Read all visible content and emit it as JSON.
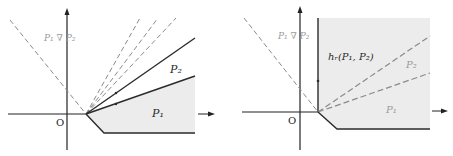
{
  "colors": {
    "axis": "#222222",
    "solid_line": "#2b2b2b",
    "dashed_line": "#8a8a8a",
    "fill": "#ececec",
    "gray_label": "#9a9a9a"
  },
  "left_panel": {
    "origin_label": "O",
    "widen_label": "P₁ ∇ P₂",
    "p2_label": "P₂",
    "p1_label": "P₁"
  },
  "right_panel": {
    "origin_label": "O",
    "widen_label": "P₁ ∇ P₂",
    "hull_label": "hᵣ(P₁, P₂)",
    "p2_label": "P₂",
    "p1_label": "P₁"
  }
}
